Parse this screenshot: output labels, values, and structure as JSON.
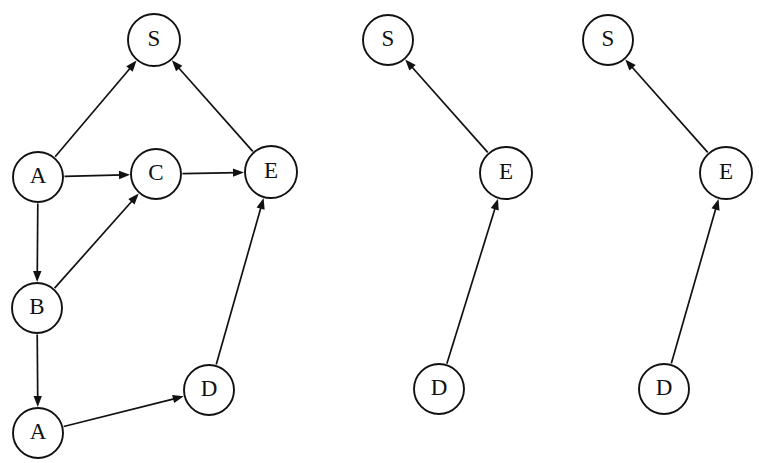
{
  "figure": {
    "background_color": "#ffffff",
    "stroke_color": "#111111",
    "node_fill": "#ffffff",
    "node_radius": 25
  },
  "graphs": [
    {
      "id": "left-graph",
      "name": "full-graph",
      "nodes": [
        {
          "id": "S",
          "label": "S",
          "cx": 154,
          "cy": 40,
          "r": 26
        },
        {
          "id": "A1",
          "label": "A",
          "cx": 38,
          "cy": 177,
          "r": 25
        },
        {
          "id": "C",
          "label": "C",
          "cx": 156,
          "cy": 174,
          "r": 25
        },
        {
          "id": "E",
          "label": "E",
          "cx": 271,
          "cy": 172,
          "r": 26
        },
        {
          "id": "B",
          "label": "B",
          "cx": 37,
          "cy": 308,
          "r": 25
        },
        {
          "id": "D",
          "label": "D",
          "cx": 209,
          "cy": 390,
          "r": 25
        },
        {
          "id": "A2",
          "label": "A",
          "cx": 38,
          "cy": 433,
          "r": 25
        }
      ],
      "edges": [
        {
          "from": "A1",
          "to": "S",
          "directed": true
        },
        {
          "from": "E",
          "to": "S",
          "directed": true
        },
        {
          "from": "A1",
          "to": "C",
          "directed": true
        },
        {
          "from": "C",
          "to": "E",
          "directed": true
        },
        {
          "from": "A1",
          "to": "B",
          "directed": true
        },
        {
          "from": "B",
          "to": "C",
          "directed": true
        },
        {
          "from": "B",
          "to": "A2",
          "directed": true
        },
        {
          "from": "A2",
          "to": "D",
          "directed": true
        },
        {
          "from": "D",
          "to": "E",
          "directed": true
        }
      ]
    },
    {
      "id": "middle-graph",
      "name": "path-graph-1",
      "nodes": [
        {
          "id": "S",
          "label": "S",
          "cx": 388,
          "cy": 40,
          "r": 25
        },
        {
          "id": "E",
          "label": "E",
          "cx": 506,
          "cy": 173,
          "r": 26
        },
        {
          "id": "D",
          "label": "D",
          "cx": 439,
          "cy": 389,
          "r": 25
        }
      ],
      "edges": [
        {
          "from": "E",
          "to": "S",
          "directed": true
        },
        {
          "from": "D",
          "to": "E",
          "directed": true
        }
      ]
    },
    {
      "id": "right-graph",
      "name": "path-graph-2",
      "nodes": [
        {
          "id": "S",
          "label": "S",
          "cx": 608,
          "cy": 40,
          "r": 25
        },
        {
          "id": "E",
          "label": "E",
          "cx": 726,
          "cy": 173,
          "r": 26
        },
        {
          "id": "D",
          "label": "D",
          "cx": 664,
          "cy": 389,
          "r": 25
        }
      ],
      "edges": [
        {
          "from": "E",
          "to": "S",
          "directed": true
        },
        {
          "from": "D",
          "to": "E",
          "directed": true
        }
      ]
    }
  ]
}
